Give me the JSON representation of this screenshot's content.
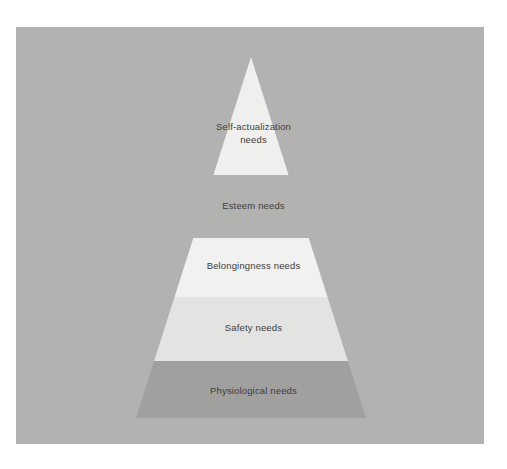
{
  "page": {
    "top_caption": "",
    "background_color": "#ffffff",
    "panel_color": "#b2b2b1"
  },
  "diagram": {
    "name": "maslow-hierarchy-of-needs-pyramid",
    "type": "pyramid",
    "apex": {
      "x": 251,
      "y": 57
    },
    "base": {
      "left_x": 42,
      "right_x": 460,
      "y": 418
    },
    "divider_y": [
      175,
      238,
      297,
      361
    ],
    "text_color": "#3e3e3e",
    "tiers": [
      {
        "id": "self-actualization",
        "label": "Self-actualization",
        "label_line2": "needs",
        "level": 5,
        "fill": "#efefed",
        "top_y": 57,
        "bottom_y": 175
      },
      {
        "id": "esteem",
        "label": "Esteem needs",
        "label_line2": "",
        "level": 4,
        "fill": "#b2b2b1",
        "top_y": 175,
        "bottom_y": 238
      },
      {
        "id": "belongingness",
        "label": "Belongingness needs",
        "label_line2": "",
        "level": 3,
        "fill": "#f1f1ef",
        "top_y": 238,
        "bottom_y": 297
      },
      {
        "id": "safety",
        "label": "Safety needs",
        "label_line2": "",
        "level": 2,
        "fill": "#e3e3e1",
        "top_y": 297,
        "bottom_y": 361
      },
      {
        "id": "physiological",
        "label": "Physiological needs",
        "label_line2": "",
        "level": 1,
        "fill": "#a0a09f",
        "top_y": 361,
        "bottom_y": 418
      }
    ]
  }
}
